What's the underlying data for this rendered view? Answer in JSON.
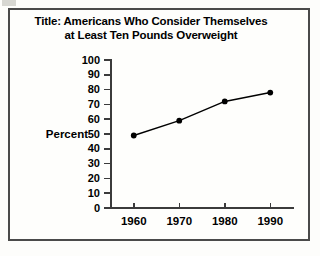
{
  "figure": {
    "title_line1": "Title: Americans Who Consider Themselves",
    "title_line2": "at Least Ten Pounds Overweight",
    "border_color": "#4a4a4a",
    "background_color": "#fefefc",
    "axis_color": "#3b3b3b",
    "series_color": "#000000"
  },
  "chart_data": {
    "type": "line",
    "title": "Title: Americans Who Consider Themselves at Least Ten Pounds Overweight",
    "xlabel": "",
    "ylabel": "Percent",
    "x": [
      1960,
      1970,
      1980,
      1990
    ],
    "categories": [
      "1960",
      "1970",
      "1980",
      "1990"
    ],
    "values": [
      49,
      59,
      72,
      78
    ],
    "series": [
      {
        "name": "Percent",
        "values": [
          49,
          59,
          72,
          78
        ]
      }
    ],
    "ylim": [
      0,
      100
    ],
    "ytick_step": 10,
    "yticks": [
      100,
      90,
      80,
      70,
      60,
      50,
      40,
      30,
      20,
      10,
      0
    ],
    "ytick_labels": [
      "100",
      "90",
      "80",
      "70",
      "60",
      "50",
      "40",
      "30",
      "20",
      "10",
      "0"
    ],
    "xticks": [
      1960,
      1970,
      1980,
      1990
    ],
    "xtick_labels": [
      "1960",
      "1970",
      "1980",
      "1990"
    ],
    "grid": false,
    "legend": false,
    "markers": "filled-circle",
    "line_style": "solid"
  }
}
